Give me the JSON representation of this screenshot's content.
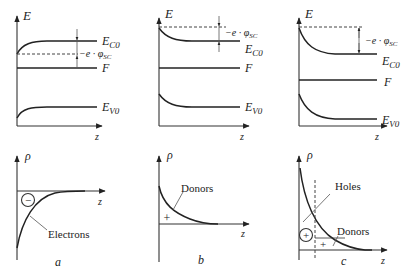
{
  "panels": [
    {
      "id": "a",
      "label": "a",
      "energy": {
        "y_axis": "E",
        "x_axis": "z",
        "labels": {
          "conduction": "E",
          "conduction_sub": "C0",
          "fermi": "F",
          "valence": "E",
          "valence_sub": "V0",
          "potential": "−e · φ",
          "potential_sub": "SC"
        }
      },
      "charge": {
        "y_axis": "ρ",
        "x_axis": "z",
        "symbol": "−",
        "annotation": "Electrons"
      }
    },
    {
      "id": "b",
      "label": "b",
      "energy": {
        "y_axis": "E",
        "x_axis": "z",
        "labels": {
          "conduction": "E",
          "conduction_sub": "C0",
          "fermi": "F",
          "valence": "E",
          "valence_sub": "V0",
          "potential": "−e · φ",
          "potential_sub": "SC"
        }
      },
      "charge": {
        "y_axis": "ρ",
        "x_axis": "z",
        "symbol": "+",
        "annotation": "Donors"
      }
    },
    {
      "id": "c",
      "label": "c",
      "energy": {
        "y_axis": "E",
        "x_axis": "z",
        "labels": {
          "conduction": "E",
          "conduction_sub": "C0",
          "fermi": "F",
          "valence": "E",
          "valence_sub": "V0",
          "potential": "−e · φ",
          "potential_sub": "SC"
        }
      },
      "charge": {
        "y_axis": "ρ",
        "x_axis": "z",
        "symbol_circle": "+",
        "symbol_plain": "+",
        "annotation_1": "Holes",
        "annotation_2": "Donors"
      }
    }
  ]
}
